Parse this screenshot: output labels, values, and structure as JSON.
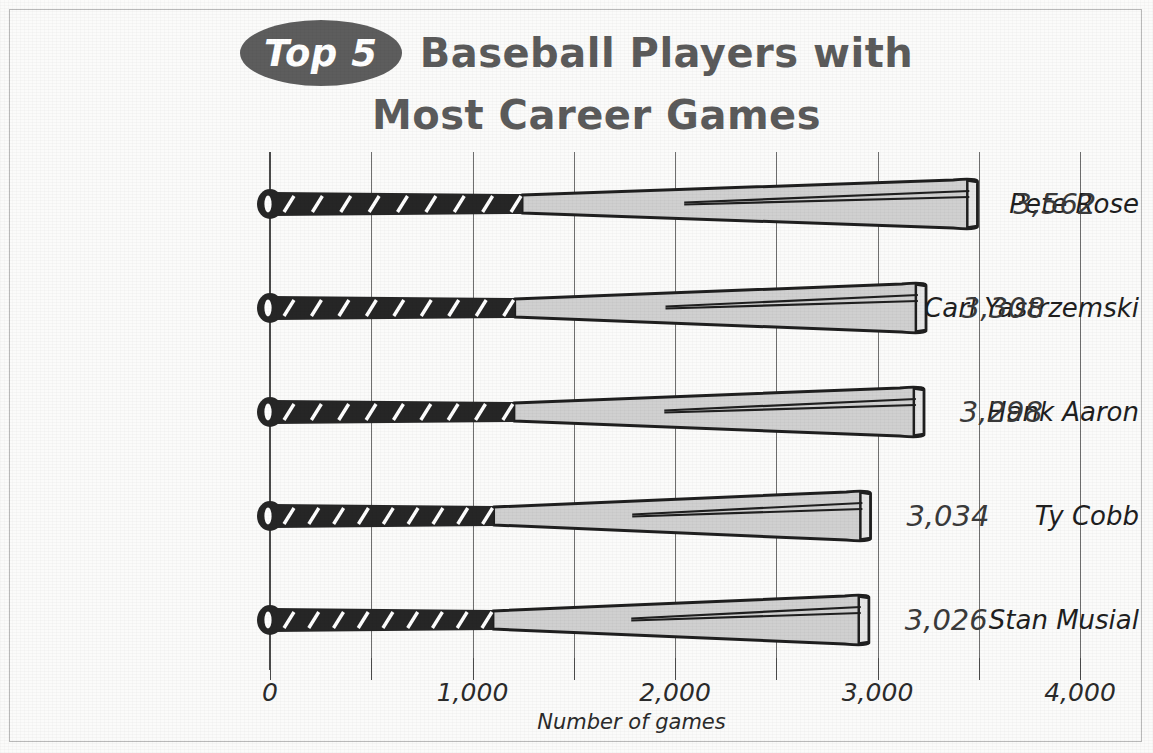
{
  "title": {
    "badge": "Top 5",
    "line1": "Baseball Players with",
    "line2": "Most Career Games"
  },
  "colors": {
    "badge_fill": "#5d5d5d",
    "title_text": "#5b5b5b",
    "grip_dark": "#262626",
    "barrel_fill": "#d0d0d0",
    "outline": "#1f1f1f",
    "gridline": "#6f6f6f",
    "page_bg": "#fbfbfa"
  },
  "axis": {
    "title": "Number of games",
    "tick_labels": [
      "0",
      "1,000",
      "2,000",
      "3,000",
      "4,000"
    ],
    "tick_values": [
      0,
      1000,
      2000,
      3000,
      4000
    ],
    "minor_tick_values": [
      500,
      1500,
      2500,
      3500
    ],
    "min": 0,
    "max": 4000
  },
  "rows": [
    {
      "name": "Pete Rose",
      "value": 3562,
      "value_label": "3,562"
    },
    {
      "name": "Carl Yastrzemski",
      "value": 3308,
      "value_label": "3,308"
    },
    {
      "name": "Hank Aaron",
      "value": 3298,
      "value_label": "3,298"
    },
    {
      "name": "Ty Cobb",
      "value": 3034,
      "value_label": "3,034"
    },
    {
      "name": "Stan Musial",
      "value": 3026,
      "value_label": "3,026"
    }
  ],
  "chart_data": {
    "type": "bar",
    "orientation": "horizontal",
    "title": "Top 5 Baseball Players with Most Career Games",
    "categories": [
      "Pete Rose",
      "Carl Yastrzemski",
      "Hank Aaron",
      "Ty Cobb",
      "Stan Musial"
    ],
    "values": [
      3562,
      3308,
      3298,
      3034,
      3026
    ],
    "data_labels": [
      "3,562",
      "3,308",
      "3,298",
      "3,034",
      "3,026"
    ],
    "xlabel": "Number of games",
    "ylabel": "",
    "xlim": [
      0,
      4000
    ],
    "xticks": [
      0,
      1000,
      2000,
      3000,
      4000
    ],
    "xticklabels": [
      "0",
      "1,000",
      "2,000",
      "3,000",
      "4,000"
    ],
    "grid": true,
    "grid_axis": "x",
    "grid_interval": 500,
    "legend": "none",
    "bar_style": "baseball-bat-pictogram"
  }
}
